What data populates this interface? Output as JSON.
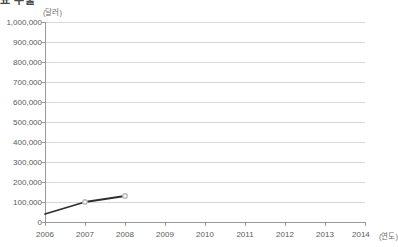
{
  "top_fragment": {
    "text": "표 수출"
  },
  "chart_data": {
    "type": "line",
    "title": "",
    "subtitle": "",
    "xlabel": "(연도)",
    "ylabel": "(달러)",
    "y_unit_label": "(달러)",
    "x_unit_label": "(연도)",
    "categories": [
      "2006",
      "2007",
      "2008",
      "2009",
      "2010",
      "2011",
      "2012",
      "2013",
      "2014"
    ],
    "x_tick_labels": [
      "2006",
      "2007",
      "2008",
      "2009",
      "2010",
      "2011",
      "2012",
      "2013",
      "2014"
    ],
    "y_tick_labels": [
      "1,000,000",
      "900,000",
      "800,000",
      "700,000",
      "600,000",
      "500,000",
      "400,000",
      "300,000",
      "200,000",
      "100,000",
      "0"
    ],
    "y_tick_values": [
      1000000,
      900000,
      800000,
      700000,
      600000,
      500000,
      400000,
      300000,
      200000,
      100000,
      0
    ],
    "ylim": [
      0,
      1000000
    ],
    "grid": true,
    "legend": "none",
    "series": [
      {
        "name": "수출액",
        "x": [
          "2006",
          "2007",
          "2008"
        ],
        "values": [
          40000,
          100000,
          130000
        ],
        "line_color": "#2e2e2e",
        "marker_color": "#b9b9b9"
      }
    ]
  },
  "style": {
    "axis_color": "#9a9a9a",
    "grid_color": "#d8d8d8",
    "text_color": "#5a5a5a",
    "background": "#ffffff"
  }
}
